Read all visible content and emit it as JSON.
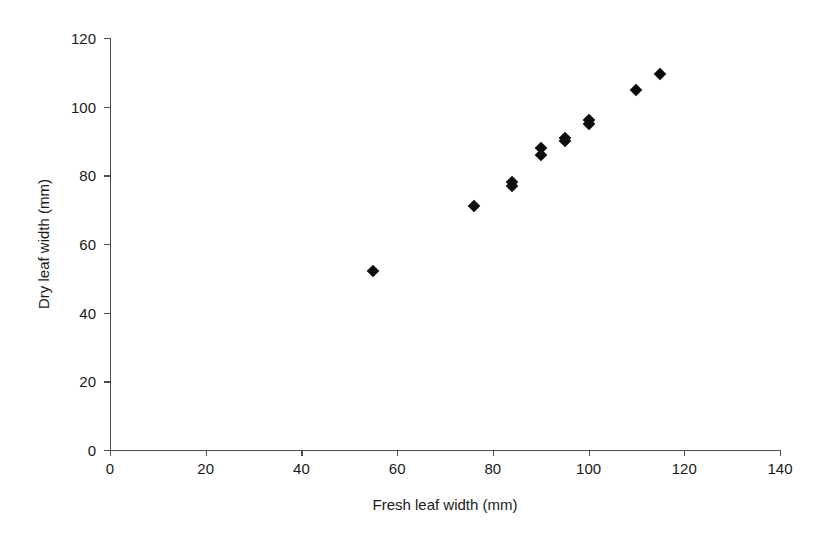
{
  "chart_data": {
    "type": "scatter",
    "title": "",
    "xlabel": "Fresh leaf width (mm)",
    "ylabel": "Dry leaf width (mm)",
    "xlim": [
      0,
      140
    ],
    "ylim": [
      0,
      120
    ],
    "xticks": [
      0,
      20,
      40,
      60,
      80,
      100,
      120,
      140
    ],
    "yticks": [
      0,
      20,
      40,
      60,
      80,
      100,
      120
    ],
    "grid": false,
    "legend": false,
    "marker": "filled-diamond",
    "marker_color": "#0d0d0d",
    "series": [
      {
        "name": "leaf width",
        "points": [
          {
            "x": 55,
            "y": 52
          },
          {
            "x": 76,
            "y": 71
          },
          {
            "x": 84,
            "y": 78
          },
          {
            "x": 84,
            "y": 77
          },
          {
            "x": 90,
            "y": 88
          },
          {
            "x": 90,
            "y": 86
          },
          {
            "x": 95,
            "y": 91
          },
          {
            "x": 95,
            "y": 90
          },
          {
            "x": 100,
            "y": 96
          },
          {
            "x": 100,
            "y": 95
          },
          {
            "x": 110,
            "y": 105
          },
          {
            "x": 115,
            "y": 109.5
          }
        ]
      }
    ]
  },
  "axis": {
    "x_title": "Fresh leaf width (mm)",
    "y_title": "Dry leaf width (mm)",
    "x_tick_labels": [
      "0",
      "20",
      "40",
      "60",
      "80",
      "100",
      "120",
      "140"
    ],
    "y_tick_labels": [
      "0",
      "20",
      "40",
      "60",
      "80",
      "100",
      "120"
    ]
  },
  "colors": {
    "marker": "#0d0d0d",
    "axis": "#4d4d4d",
    "text": "#1a1a1a",
    "background": "#ffffff"
  }
}
